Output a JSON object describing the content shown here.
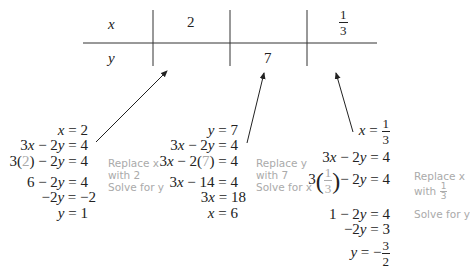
{
  "table": {
    "row_x_label": "x",
    "row_y_label": "y",
    "columns": [
      {
        "x": "2",
        "y": ""
      },
      {
        "x": "",
        "y": "7"
      },
      {
        "x_num": "1",
        "x_den": "3",
        "y": ""
      }
    ]
  },
  "solutions": [
    {
      "lines": [
        "x = 2",
        "3x − 2y = 4",
        "3(2) − 2y = 4",
        "6 − 2y = 4",
        "−2y = −2",
        "y = 1"
      ],
      "note": [
        "Replace x",
        "with 2",
        "Solve for y"
      ]
    },
    {
      "lines": [
        "y = 7",
        "3x − 2y = 4",
        "3x − 2(7) = 4",
        "3x − 14 = 4",
        "3x = 18",
        "x = 6"
      ],
      "note": [
        "Replace y",
        "with 7",
        "Solve for x"
      ]
    },
    {
      "lines": [
        "x = 1/3",
        "3x − 2y = 4",
        "3(1/3) − 2y = 4",
        "1 − 2y = 4",
        "−2y = 3",
        "y = −3/2"
      ],
      "note": [
        "Replace x",
        "with 1/3",
        "Solve for y"
      ]
    }
  ]
}
